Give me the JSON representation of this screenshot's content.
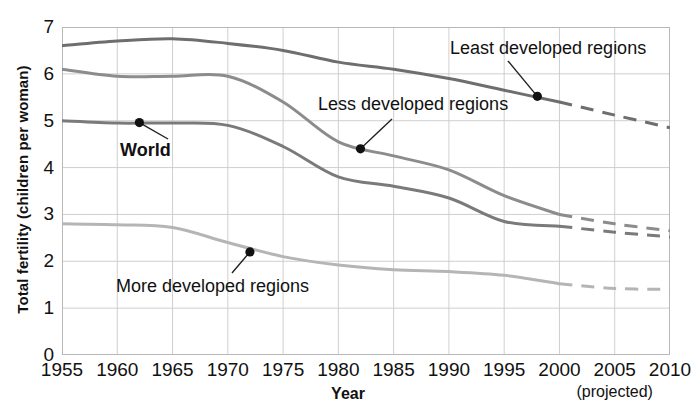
{
  "chart_data": {
    "type": "line",
    "title": "",
    "xlabel": "Year",
    "ylabel": "Total fertility (children per woman)",
    "x": [
      1955,
      1960,
      1965,
      1970,
      1975,
      1980,
      1985,
      1990,
      1995,
      2000,
      2005,
      2010
    ],
    "xlim": [
      1955,
      2010
    ],
    "ylim": [
      0,
      7
    ],
    "y_ticks": [
      0,
      1,
      2,
      3,
      4,
      5,
      6,
      7
    ],
    "x_ticks": [
      "1955",
      "1960",
      "1965",
      "1970",
      "1975",
      "1980",
      "1985",
      "1990",
      "1995",
      "2000",
      "2005",
      "2010"
    ],
    "projected_note": "(projected)",
    "projected_from": 2000,
    "grid": true,
    "legend": "in-plot annotations with leader lines",
    "series": [
      {
        "name": "Least developed regions",
        "color": "#6e6e6e",
        "values": [
          6.6,
          6.7,
          6.75,
          6.65,
          6.5,
          6.25,
          6.1,
          5.9,
          5.65,
          5.4,
          5.12,
          4.85
        ],
        "marker": {
          "x": 1998,
          "y": 5.52
        }
      },
      {
        "name": "Less developed regions",
        "color": "#8c8c8c",
        "values": [
          6.1,
          5.95,
          5.95,
          5.95,
          5.4,
          4.55,
          4.25,
          3.95,
          3.4,
          3.0,
          2.8,
          2.65
        ],
        "marker": {
          "x": 1982,
          "y": 4.4
        }
      },
      {
        "name": "World",
        "color": "#7a7a7a",
        "values": [
          5.0,
          4.95,
          4.95,
          4.9,
          4.45,
          3.8,
          3.6,
          3.35,
          2.85,
          2.75,
          2.62,
          2.52
        ],
        "marker": {
          "x": 1962,
          "y": 4.96
        }
      },
      {
        "name": "More developed regions",
        "color": "#b5b5b5",
        "values": [
          2.8,
          2.78,
          2.72,
          2.4,
          2.1,
          1.92,
          1.82,
          1.78,
          1.7,
          1.52,
          1.42,
          1.4
        ],
        "marker": {
          "x": 1972,
          "y": 2.2
        }
      }
    ],
    "annotations": [
      {
        "text": "Least developed regions",
        "bold": false
      },
      {
        "text": "Less developed regions",
        "bold": false
      },
      {
        "text": "World",
        "bold": true
      },
      {
        "text": "More developed regions",
        "bold": false
      }
    ]
  }
}
